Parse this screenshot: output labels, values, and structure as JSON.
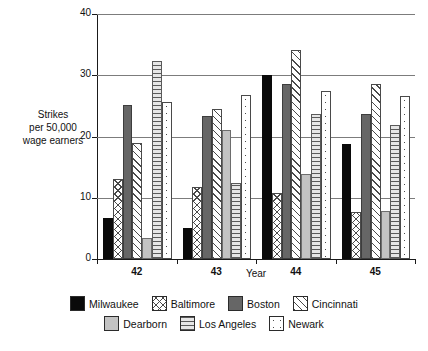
{
  "chart_data": {
    "type": "bar",
    "title": "",
    "xlabel": "Year",
    "ylabel": "Strikes per 50,000 wage earners",
    "ylabel_lines": [
      "Strikes",
      "per 50,000",
      "wage earners"
    ],
    "categories": [
      "42",
      "43",
      "44",
      "45"
    ],
    "ylim": [
      0,
      40
    ],
    "yticks": [
      0,
      10,
      20,
      30,
      40
    ],
    "ytick_labels": [
      "0",
      "10",
      "20",
      "30",
      "40"
    ],
    "grid": true,
    "grid_axis": "y",
    "legend_position": "bottom",
    "series": [
      {
        "name": "Milwaukee",
        "pattern": "solid-black",
        "color": "#0a0a0a",
        "values": [
          6.7,
          5.0,
          30.0,
          18.7
        ]
      },
      {
        "name": "Baltimore",
        "pattern": "crosshatch",
        "color": "#4a4a4a",
        "values": [
          13.0,
          11.7,
          10.8,
          7.6
        ]
      },
      {
        "name": "Boston",
        "pattern": "solid-dark",
        "color": "#666666",
        "values": [
          25.2,
          23.4,
          28.6,
          23.7
        ]
      },
      {
        "name": "Cincinnati",
        "pattern": "diagonal",
        "color": "#4a4a4a",
        "values": [
          19.0,
          24.5,
          34.1,
          28.5
        ]
      },
      {
        "name": "Dearborn",
        "pattern": "solid-light",
        "color": "#c3c3c3",
        "values": [
          3.4,
          21.1,
          13.8,
          7.8
        ]
      },
      {
        "name": "Los Angeles",
        "pattern": "horizontal",
        "color": "#5a5a5a",
        "values": [
          32.3,
          12.4,
          23.6,
          21.8
        ]
      },
      {
        "name": "Newark",
        "pattern": "dotted",
        "color": "#4a4a4a",
        "values": [
          25.6,
          26.7,
          27.5,
          26.6
        ]
      }
    ]
  },
  "legend": {
    "row1": [
      "Milwaukee",
      "Baltimore",
      "Boston",
      "Cincinnati"
    ],
    "row2": [
      "Dearborn",
      "Los Angeles",
      "Newark"
    ]
  },
  "axes": {
    "x_title": "Year",
    "y_line1": "Strikes",
    "y_line2": "per 50,000",
    "y_line3": "wage earners"
  }
}
